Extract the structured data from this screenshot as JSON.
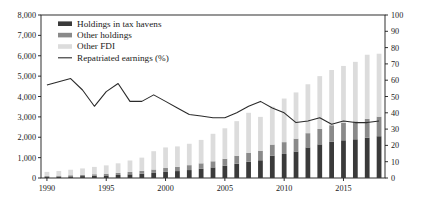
{
  "chart_data": {
    "type": "bar",
    "title": "",
    "subtitle": "",
    "xlabel": "",
    "ylabel": "",
    "y2label": "",
    "grid": false,
    "legend_position": "top-left",
    "xlim": [
      1990,
      2018
    ],
    "ylim": [
      0,
      8000
    ],
    "y2lim": [
      0,
      100
    ],
    "ytick_labels": [
      "0",
      "1,000",
      "2,000",
      "3,000",
      "4,000",
      "5,000",
      "6,000",
      "7,000",
      "8,000"
    ],
    "ytick_values": [
      0,
      1000,
      2000,
      3000,
      4000,
      5000,
      6000,
      7000,
      8000
    ],
    "y2tick_labels": [
      "0",
      "10",
      "20",
      "30",
      "40",
      "50",
      "60",
      "70",
      "80",
      "90",
      "100"
    ],
    "y2tick_values": [
      0,
      10,
      20,
      30,
      40,
      50,
      60,
      70,
      80,
      90,
      100
    ],
    "xtick_labels": [
      "1990",
      "1995",
      "2000",
      "2005",
      "2010",
      "2015"
    ],
    "xtick_values": [
      1990,
      1995,
      2000,
      2005,
      2010,
      2015
    ],
    "categories": [
      1990,
      1991,
      1992,
      1993,
      1994,
      1995,
      1996,
      1997,
      1998,
      1999,
      2000,
      2001,
      2002,
      2003,
      2004,
      2005,
      2006,
      2007,
      2008,
      2009,
      2010,
      2011,
      2012,
      2013,
      2014,
      2015,
      2016,
      2017,
      2018
    ],
    "series": [
      {
        "name": "Holdings in tax havens",
        "color": "#3a3a3a",
        "type": "bar-stacked",
        "axis": "left",
        "values": [
          60,
          70,
          80,
          95,
          110,
          125,
          150,
          180,
          210,
          250,
          300,
          340,
          390,
          450,
          520,
          600,
          700,
          800,
          870,
          1100,
          1180,
          1300,
          1500,
          1650,
          1780,
          1850,
          1900,
          1980,
          2050
        ]
      },
      {
        "name": "Other holdings",
        "color": "#8a8a8a",
        "type": "bar-stacked",
        "axis": "left",
        "values": [
          40,
          45,
          55,
          65,
          75,
          85,
          100,
          120,
          140,
          165,
          190,
          210,
          240,
          270,
          300,
          340,
          390,
          440,
          470,
          540,
          580,
          630,
          700,
          760,
          810,
          850,
          880,
          920,
          960
        ]
      },
      {
        "name": "Other FDI",
        "color": "#dcdcdc",
        "type": "bar-stacked",
        "axis": "left",
        "values": [
          200,
          230,
          270,
          310,
          360,
          410,
          470,
          560,
          650,
          900,
          1010,
          1000,
          1050,
          1150,
          1350,
          1500,
          1700,
          1960,
          1660,
          1860,
          2140,
          2270,
          2400,
          2590,
          2710,
          2800,
          2920,
          3150,
          3090
        ]
      },
      {
        "name": "Repatriated earnings (%)",
        "color": "#2b2b2b",
        "type": "line",
        "axis": "right",
        "values": [
          57,
          59,
          61,
          54,
          44,
          53,
          58,
          47,
          47,
          51,
          47,
          43,
          39,
          38,
          37,
          37,
          40,
          44,
          47,
          43,
          40,
          34,
          35,
          37,
          33,
          35,
          34,
          34,
          35
        ]
      }
    ]
  },
  "legend": {
    "items": [
      {
        "label": "Holdings in tax havens",
        "marker": "swatch"
      },
      {
        "label": "Other holdings",
        "marker": "swatch"
      },
      {
        "label": "Other FDI",
        "marker": "swatch"
      },
      {
        "label": "Repatriated earnings (%)",
        "marker": "line"
      }
    ]
  }
}
